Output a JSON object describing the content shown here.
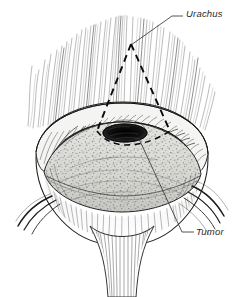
{
  "figure": {
    "kind": "anatomical-line-illustration",
    "background_color": "#ffffff",
    "ink_color": "#1a1a1a",
    "mucosa_fill": "#d9d9d6",
    "tumor_color": "#101010"
  },
  "labels": [
    {
      "id": "urachus",
      "text": "Urachus",
      "x": 186,
      "y": 8
    },
    {
      "id": "tumor",
      "text": "Tumor",
      "x": 196,
      "y": 226
    }
  ],
  "leaders": {
    "urachus": "M183,16 L172,16 L131,45",
    "tumor": "M194,232 L182,232 L139,139"
  },
  "resection_margin": {
    "style": "dashed",
    "path": "M131,44 L97,131 M131,44 L170,131",
    "dash": "7 5"
  }
}
